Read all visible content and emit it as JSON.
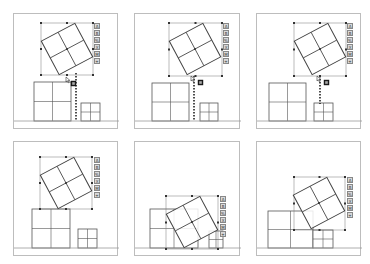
{
  "figure": {
    "panels": [
      {
        "id": 1,
        "box": {
          "x": 13,
          "y": 13,
          "w": 105,
          "h": 116
        },
        "ground_y": 107,
        "selection": {
          "x": 27,
          "y": 9,
          "w": 52,
          "h": 52
        },
        "rotated_square": {
          "cx": 53,
          "cy": 35,
          "size": 38,
          "angle": -28
        },
        "big_square": {
          "x": 20,
          "y": 68,
          "w": 37,
          "h": 39
        },
        "small_square": {
          "x": 67,
          "y": 89,
          "w": 19,
          "h": 18
        },
        "guide_line": {
          "x": 62,
          "y1": 59,
          "y2": 107
        },
        "cursor": {
          "x": 52,
          "y": 63
        },
        "badge": {
          "x": 57,
          "y": 67
        },
        "toolbar": {
          "x": 80,
          "y": 9
        }
      },
      {
        "id": 2,
        "box": {
          "x": 134,
          "y": 13,
          "w": 106,
          "h": 116
        },
        "ground_y": 107,
        "selection": {
          "x": 34,
          "y": 9,
          "w": 53,
          "h": 53
        },
        "rotated_square": {
          "cx": 60,
          "cy": 35,
          "size": 38,
          "angle": -28
        },
        "big_square": {
          "x": 17,
          "y": 69,
          "w": 37,
          "h": 38
        },
        "small_square": {
          "x": 65,
          "y": 89,
          "w": 18,
          "h": 18
        },
        "guide_line": {
          "x": 59,
          "y1": 62,
          "y2": 107
        },
        "cursor": {
          "x": 56,
          "y": 62
        },
        "badge": {
          "x": 63,
          "y": 66
        },
        "toolbar": {
          "x": 88,
          "y": 9
        }
      },
      {
        "id": 3,
        "box": {
          "x": 256,
          "y": 13,
          "w": 105,
          "h": 116
        },
        "ground_y": 107,
        "selection": {
          "x": 37,
          "y": 9,
          "w": 52,
          "h": 53
        },
        "rotated_square": {
          "cx": 63,
          "cy": 35,
          "size": 38,
          "angle": -28
        },
        "big_square": {
          "x": 12,
          "y": 69,
          "w": 37,
          "h": 38
        },
        "small_square": {
          "x": 57,
          "y": 89,
          "w": 19,
          "h": 18
        },
        "guide_line": {
          "x": 63,
          "y1": 62,
          "y2": 90
        },
        "cursor": {
          "x": 60,
          "y": 62
        },
        "badge": {
          "x": 67,
          "y": 66
        },
        "toolbar": {
          "x": 90,
          "y": 9
        }
      },
      {
        "id": 4,
        "box": {
          "x": 13,
          "y": 141,
          "w": 105,
          "h": 115
        },
        "ground_y": 106,
        "selection": {
          "x": 26,
          "y": 15,
          "w": 52,
          "h": 52
        },
        "rotated_square": {
          "cx": 52,
          "cy": 41,
          "size": 38,
          "angle": -28
        },
        "big_square": {
          "x": 18,
          "y": 67,
          "w": 38,
          "h": 39
        },
        "small_square": {
          "x": 64,
          "y": 87,
          "w": 19,
          "h": 19
        },
        "guide_line": null,
        "cursor": null,
        "badge": null,
        "toolbar": {
          "x": 80,
          "y": 15
        }
      },
      {
        "id": 5,
        "box": {
          "x": 134,
          "y": 141,
          "w": 106,
          "h": 115
        },
        "ground_y": 106,
        "selection": {
          "x": 31,
          "y": 54,
          "w": 52,
          "h": 53
        },
        "rotated_square": {
          "cx": 57,
          "cy": 80,
          "size": 38,
          "angle": -28
        },
        "big_square": {
          "x": 15,
          "y": 67,
          "w": 48,
          "h": 39
        },
        "small_square": {
          "x": 74,
          "y": 89,
          "w": 14,
          "h": 17
        },
        "guide_line": null,
        "cursor": null,
        "badge": null,
        "toolbar": {
          "x": 85,
          "y": 54
        }
      },
      {
        "id": 6,
        "box": {
          "x": 256,
          "y": 141,
          "w": 105,
          "h": 115
        },
        "ground_y": 106,
        "selection": {
          "x": 37,
          "y": 35,
          "w": 51,
          "h": 53
        },
        "rotated_square": {
          "cx": 62,
          "cy": 61,
          "size": 38,
          "angle": -28
        },
        "big_square": {
          "x": 11,
          "y": 69,
          "w": 45,
          "h": 37
        },
        "small_square": {
          "x": 56,
          "y": 88,
          "w": 20,
          "h": 18
        },
        "guide_line": null,
        "cursor": null,
        "badge": null,
        "toolbar": {
          "x": 90,
          "y": 35
        }
      }
    ],
    "toolbar_icons": [
      "text-icon",
      "style-icon",
      "format-icon",
      "crop-icon",
      "link-icon",
      "more-icon"
    ],
    "toolbar_glyphs": [
      "A",
      "B",
      "%",
      "X",
      "M",
      "+"
    ],
    "colors": {
      "frame": "#bdbdbd",
      "shape_stroke": "#555555",
      "rotated_stroke": "#444444",
      "selection": "#777777",
      "guide": "#222222",
      "ground": "#9a9a9a"
    }
  }
}
